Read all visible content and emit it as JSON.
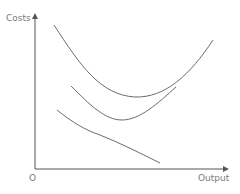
{
  "diagram": {
    "type": "cost-curves",
    "y_axis_label": "Costs",
    "x_axis_label": "Output",
    "origin_label": "O",
    "colors": {
      "axis": "#555555",
      "curve": "#6b6b6b",
      "text": "#7a7a7a",
      "background": "#ffffff"
    },
    "curves": [
      {
        "name": "upper-u-curve",
        "shape": "U",
        "description": "Upper U-shaped cost curve"
      },
      {
        "name": "middle-u-curve",
        "shape": "U",
        "description": "Middle U-shaped cost curve"
      },
      {
        "name": "lower-declining-curve",
        "shape": "declining",
        "description": "Downward-sloping cost curve"
      }
    ]
  }
}
